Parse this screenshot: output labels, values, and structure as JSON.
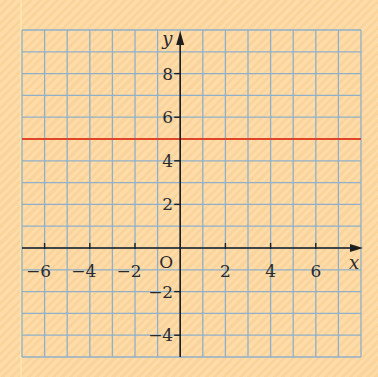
{
  "chart_data": {
    "type": "line",
    "title": "",
    "xlabel": "x",
    "ylabel": "y",
    "origin_label": "O",
    "xlim": [
      -7,
      8
    ],
    "ylim": [
      -5,
      10
    ],
    "x_ticks": [
      -6,
      -4,
      -2,
      2,
      4,
      6
    ],
    "y_ticks": [
      8,
      6,
      4,
      2,
      -2,
      -4
    ],
    "grid": true,
    "grid_step": 1,
    "series": [
      {
        "name": "y = 5",
        "x": [
          -7,
          8
        ],
        "y": [
          5,
          5
        ],
        "color": "#e0452a"
      }
    ]
  },
  "colors": {
    "background": "#fcd9a4",
    "grid": "#8fb0c8",
    "axis": "#1e1e1e",
    "line": "#e0452a"
  }
}
